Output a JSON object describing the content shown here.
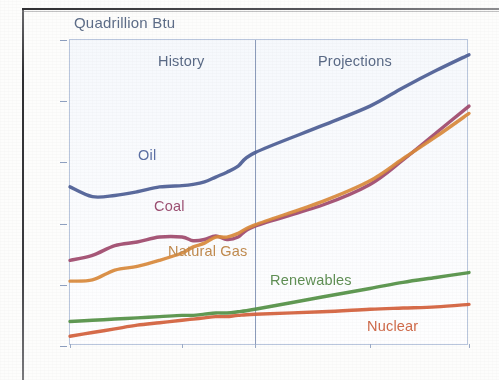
{
  "axis_title": "Quadrillion Btu",
  "annotations": {
    "history": "History",
    "projections": "Projections",
    "oil": "Oil",
    "coal": "Coal",
    "natural_gas": "Natural Gas",
    "renewables": "Renewables",
    "nuclear": "Nuclear"
  },
  "chart_data": {
    "type": "line",
    "title": "",
    "subtitle": "",
    "xlabel": "",
    "ylabel": "Quadrillion Btu",
    "xlim": [
      1980,
      2030
    ],
    "ylim": [
      0,
      250
    ],
    "grid": false,
    "legend_position": "inline-labels",
    "x_ticks": [
      "1980",
      "1990",
      "2003",
      "2015",
      "2030"
    ],
    "x_tick_values": [
      1980,
      1990,
      2003,
      2015,
      2030
    ],
    "y_ticks": [
      "0",
      "50",
      "100",
      "150",
      "200",
      "250"
    ],
    "y_tick_values": [
      0,
      50,
      100,
      150,
      200,
      250
    ],
    "divider_x": 2003,
    "divider_label_left": "History",
    "divider_label_right": "Projections",
    "x": [
      1980,
      1982,
      1984,
      1986,
      1988,
      1990,
      1992,
      1994,
      1996,
      1998,
      2000,
      2003,
      2010,
      2015,
      2020,
      2025,
      2030
    ],
    "series": [
      {
        "name": "Oil",
        "color": "#4e5f96",
        "values": [
          130,
          122,
          123,
          126,
          130,
          131,
          132,
          134,
          138,
          142,
          147,
          158,
          180,
          196,
          211,
          225,
          238
        ]
      },
      {
        "name": "Coal",
        "color": "#a04a6e",
        "values": [
          70,
          74,
          82,
          85,
          89,
          89,
          86,
          87,
          90,
          87,
          89,
          98,
          115,
          132,
          152,
          174,
          196
        ]
      },
      {
        "name": "Natural Gas",
        "color": "#d98a3c",
        "values": [
          53,
          54,
          62,
          65,
          70,
          76,
          81,
          84,
          89,
          89,
          92,
          99,
          118,
          135,
          153,
          171,
          190
        ]
      },
      {
        "name": "Renewables",
        "color": "#549146",
        "values": [
          20,
          21,
          22,
          23,
          24,
          25,
          25,
          26,
          27,
          27,
          28,
          30,
          40,
          47,
          52,
          56,
          60
        ]
      },
      {
        "name": "Nuclear",
        "color": "#d4613c",
        "values": [
          8,
          11,
          14,
          17,
          19,
          21,
          22,
          23,
          24,
          24,
          25,
          26,
          28,
          30,
          31,
          32,
          34
        ]
      }
    ]
  },
  "colors": {
    "oil": "#4e5f96",
    "coal": "#a04a6e",
    "natural_gas": "#d98a3c",
    "renewables": "#549146",
    "nuclear": "#d4613c",
    "axis": "#5a6a86",
    "plot_border": "#b9c6dd"
  }
}
